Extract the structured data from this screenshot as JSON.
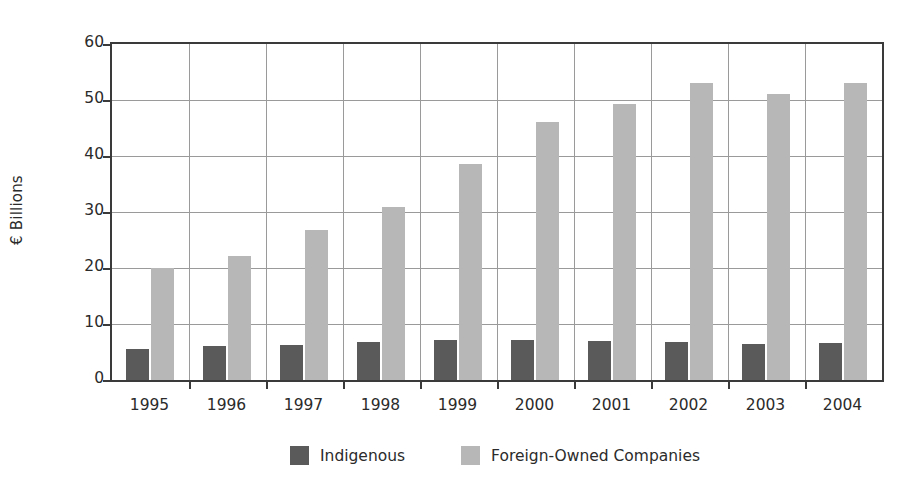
{
  "chart_data": {
    "type": "bar",
    "title": "",
    "subtitle": "",
    "xlabel": "",
    "ylabel": "€ Billions",
    "categories": [
      "1995",
      "1996",
      "1997",
      "1998",
      "1999",
      "2000",
      "2001",
      "2002",
      "2003",
      "2004"
    ],
    "series": [
      {
        "name": "Indigenous",
        "color": "#5a5a5a",
        "values": [
          5.5,
          6.0,
          6.2,
          6.7,
          7.1,
          7.1,
          6.9,
          6.8,
          6.4,
          6.6
        ]
      },
      {
        "name": "Foreign-Owned Companies",
        "color": "#b7b7b7",
        "values": [
          20.0,
          22.2,
          26.7,
          30.9,
          38.6,
          46.1,
          49.3,
          53.0,
          51.1,
          53.0
        ]
      }
    ],
    "ylim": [
      0,
      60
    ],
    "yticks": [
      0,
      10,
      20,
      30,
      40,
      50,
      60
    ],
    "ytick_labels": [
      "0",
      "10",
      "20",
      "30",
      "40",
      "50",
      "60"
    ],
    "grid": "horizontal-and-vertical",
    "legend_position": "bottom-center",
    "axis_color": "#3a3a3a",
    "grid_color": "#9a9a9a",
    "background": "#ffffff"
  },
  "legend": {
    "items": [
      {
        "label": "Indigenous",
        "swatch": "indigenous"
      },
      {
        "label": "Foreign-Owned Companies",
        "swatch": "foreign"
      }
    ]
  }
}
